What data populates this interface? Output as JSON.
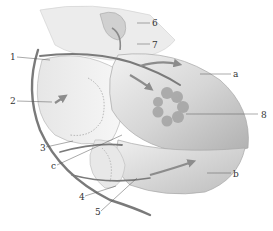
{
  "diagram": {
    "type": "anatomical-illustration",
    "colors": {
      "background": "#ffffff",
      "organ_fill": "#d9d9d9",
      "organ_light": "#eeeeee",
      "organ_dark": "#a8a8a8",
      "tube": "#7a7a7a",
      "arrow": "#8c8c8c",
      "gland_spots": "#9e9e9e",
      "leader_line": "#555555",
      "label_text": "#333333"
    },
    "labels": [
      {
        "id": "1",
        "text": "1",
        "x": 10,
        "y": 53
      },
      {
        "id": "2",
        "text": "2",
        "x": 10,
        "y": 97
      },
      {
        "id": "3",
        "text": "3",
        "x": 40,
        "y": 144
      },
      {
        "id": "c",
        "text": "c",
        "x": 51,
        "y": 162
      },
      {
        "id": "4",
        "text": "4",
        "x": 79,
        "y": 193
      },
      {
        "id": "5",
        "text": "5",
        "x": 95,
        "y": 208
      },
      {
        "id": "6",
        "text": "6",
        "x": 152,
        "y": 19
      },
      {
        "id": "7",
        "text": "7",
        "x": 152,
        "y": 41
      },
      {
        "id": "a",
        "text": "a",
        "x": 233,
        "y": 70
      },
      {
        "id": "8",
        "text": "8",
        "x": 261,
        "y": 111
      },
      {
        "id": "b",
        "text": "b",
        "x": 233,
        "y": 170
      }
    ]
  }
}
